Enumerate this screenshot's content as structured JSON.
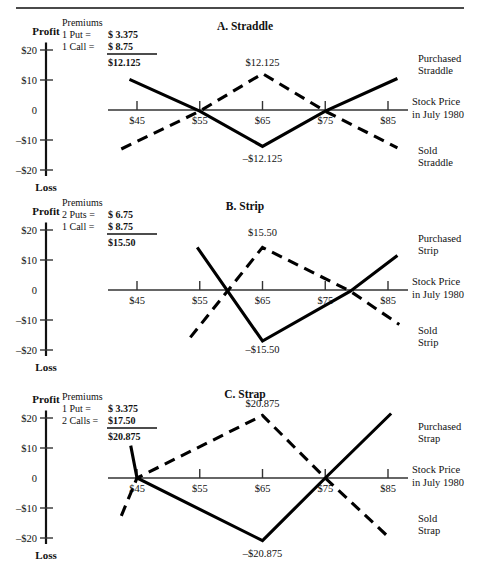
{
  "figure": {
    "axis_labels": {
      "profit": "Profit",
      "loss": "Loss"
    },
    "x_axis_caption_line1": "Stock Price",
    "x_axis_caption_line2": "in July 1980",
    "y_ticks": [
      "$20",
      "$10",
      "0",
      "–$10",
      "–$20"
    ],
    "x_ticks": [
      "$45",
      "$55",
      "$65",
      "$75",
      "$85"
    ]
  },
  "chart_data": [
    {
      "type": "line",
      "title": "A. Straddle",
      "xlabel": "Stock Price in July 1980",
      "ylabel": "Profit / Loss",
      "xlim": [
        40,
        90
      ],
      "ylim": [
        -25,
        25
      ],
      "x_ticks": [
        45,
        55,
        65,
        75,
        85
      ],
      "x_ticklabels": [
        "$45",
        "$55",
        "$65",
        "$75",
        "$85"
      ],
      "y_ticks": [
        20,
        10,
        0,
        -10,
        -20
      ],
      "y_ticklabels": [
        "$20",
        "$10",
        "0",
        "–$10",
        "–$20"
      ],
      "grid": false,
      "premiums": {
        "heading": "Premiums",
        "rows": [
          {
            "label": "1 Put =",
            "value": "$  3.375"
          },
          {
            "label": "1 Call =",
            "value": "$  8.75"
          }
        ],
        "total": "$12.125"
      },
      "annotations": [
        {
          "text": "$12.125",
          "x": 65,
          "y": 12.125
        },
        {
          "text": "–$12.125",
          "x": 65,
          "y": -12.125
        }
      ],
      "series": [
        {
          "name": "Purchased Straddle",
          "style": "solid",
          "label_lines": [
            "Purchased",
            "Straddle"
          ],
          "points": [
            [
              43.8,
              10.2
            ],
            [
              55,
              -0.4
            ],
            [
              65,
              -12.125
            ],
            [
              75,
              -0.4
            ],
            [
              86.5,
              10.5
            ]
          ]
        },
        {
          "name": "Sold Straddle",
          "style": "dashed",
          "label_lines": [
            "Sold",
            "Straddle"
          ],
          "points": [
            [
              42.5,
              -13.0
            ],
            [
              55,
              -0.4
            ],
            [
              65,
              12.125
            ],
            [
              75,
              -0.4
            ],
            [
              86.5,
              -12.6
            ]
          ]
        }
      ]
    },
    {
      "type": "line",
      "title": "B. Strip",
      "xlabel": "Stock Price in July 1980",
      "ylabel": "Profit / Loss",
      "xlim": [
        40,
        90
      ],
      "ylim": [
        -25,
        25
      ],
      "x_ticks": [
        45,
        55,
        65,
        75,
        85
      ],
      "x_ticklabels": [
        "$45",
        "$55",
        "$65",
        "$75",
        "$85"
      ],
      "y_ticks": [
        20,
        10,
        0,
        -10,
        -20
      ],
      "y_ticklabels": [
        "$20",
        "$10",
        "0",
        "–$10",
        "–$20"
      ],
      "grid": false,
      "premiums": {
        "heading": "Premiums",
        "rows": [
          {
            "label": "2 Puts =",
            "value": "$  6.75"
          },
          {
            "label": "1 Call =",
            "value": "$  8.75"
          }
        ],
        "total": "$15.50"
      },
      "annotations": [
        {
          "text": "$15.50",
          "x": 65,
          "y": 15.5
        },
        {
          "text": "–$15.50",
          "x": 65,
          "y": -15.5
        }
      ],
      "series": [
        {
          "name": "Purchased Strip",
          "style": "solid",
          "label_lines": [
            "Purchased",
            "Strip"
          ],
          "points": [
            [
              54.6,
              14.2
            ],
            [
              65,
              -17.0
            ],
            [
              79.0,
              -0.4
            ],
            [
              86.5,
              11.5
            ]
          ]
        },
        {
          "name": "Sold Strip",
          "style": "dashed",
          "label_lines": [
            "Sold",
            "Strip"
          ],
          "points": [
            [
              53.5,
              -15.8
            ],
            [
              65,
              14.2
            ],
            [
              79.0,
              -0.4
            ],
            [
              86.8,
              -11.5
            ]
          ]
        }
      ]
    },
    {
      "type": "line",
      "title": "C. Strap",
      "xlabel": "Stock Price in July 1980",
      "ylabel": "Profit / Loss",
      "xlim": [
        40,
        90
      ],
      "ylim": [
        -25,
        25
      ],
      "x_ticks": [
        45,
        55,
        65,
        75,
        85
      ],
      "x_ticklabels": [
        "$45",
        "$55",
        "$65",
        "$75",
        "$85"
      ],
      "y_ticks": [
        20,
        10,
        0,
        -10,
        -20
      ],
      "y_ticklabels": [
        "$20",
        "$10",
        "0",
        "–$10",
        "–$20"
      ],
      "grid": false,
      "premiums": {
        "heading": "Premiums",
        "rows": [
          {
            "label": "1 Put =",
            "value": "$  3.375"
          },
          {
            "label": "2 Calls =",
            "value": "$17.50"
          }
        ],
        "total": "$20.875"
      },
      "annotations": [
        {
          "text": "$20.875",
          "x": 65,
          "y": 20.875
        },
        {
          "text": "–$20.875",
          "x": 65,
          "y": -20.875
        }
      ],
      "series": [
        {
          "name": "Purchased Strap",
          "style": "solid",
          "label_lines": [
            "Purchased",
            "Strap"
          ],
          "points": [
            [
              44.0,
              10.8
            ],
            [
              45,
              0
            ],
            [
              65,
              -20.875
            ],
            [
              75,
              0
            ],
            [
              85.5,
              21.5
            ]
          ]
        },
        {
          "name": "Sold Strap",
          "style": "dashed",
          "label_lines": [
            "Sold",
            "Strap"
          ],
          "points": [
            [
              42.5,
              -12.6
            ],
            [
              45,
              0
            ],
            [
              65,
              20.875
            ],
            [
              75,
              0
            ],
            [
              85.5,
              -20.5
            ]
          ]
        }
      ]
    }
  ]
}
